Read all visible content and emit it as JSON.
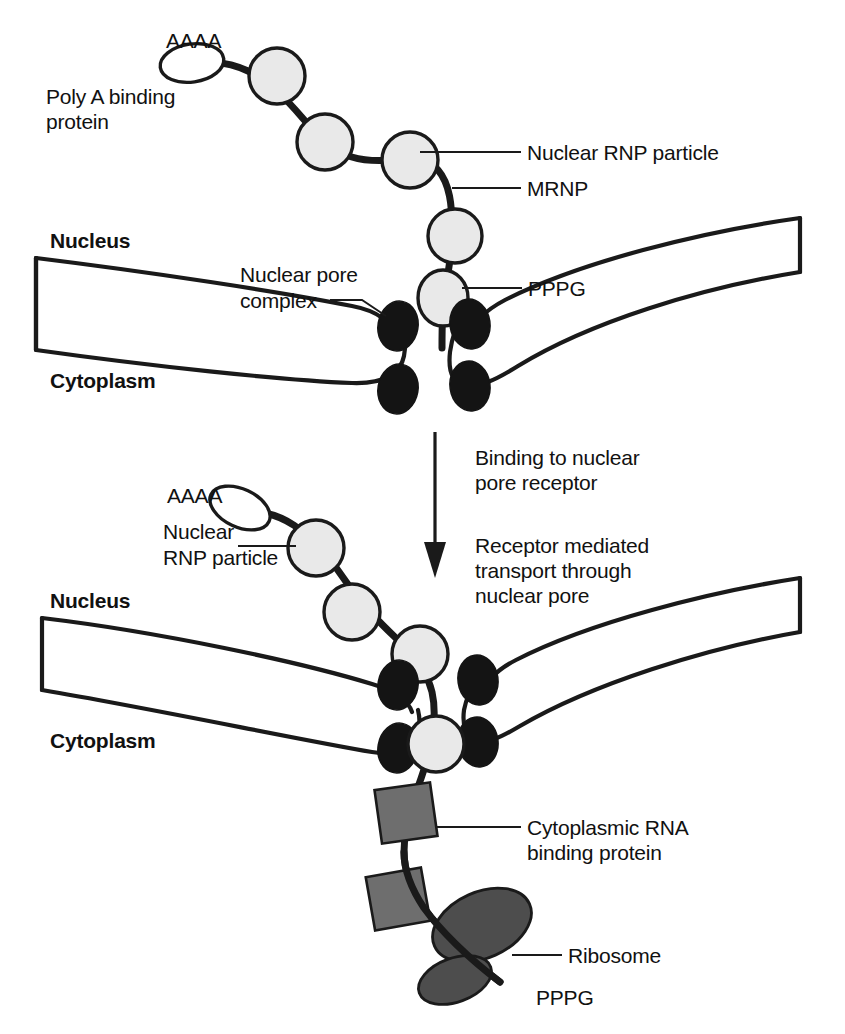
{
  "figure": {
    "background": "#ffffff",
    "ink": "#1a1a1a"
  },
  "colors": {
    "rnp_fill": "#e9e9e9",
    "polya_fill": "#ffffff",
    "pore_fill": "#141414",
    "rbp_fill": "#6e6e6e",
    "ribosome_fill": "#4d4d4d",
    "outline": "#1a1a1a"
  },
  "panel_top": {
    "labels": {
      "poly_a_tail": "AAAA",
      "poly_a_binding_protein_line1": "Poly A binding",
      "poly_a_binding_protein_line2": "protein",
      "nuclear_rnp_particle": "Nuclear RNP particle",
      "mrnp": "MRNP",
      "pppg": "PPPG",
      "nuclear_pore_complex_line1": "Nuclear pore",
      "nuclear_pore_complex_line2": "complex",
      "nucleus": "Nucleus",
      "cytoplasm": "Cytoplasm"
    }
  },
  "transition": {
    "step1_line1": "Binding to nuclear",
    "step1_line2": "pore receptor",
    "step2_line1": "Receptor mediated",
    "step2_line2": "transport through",
    "step2_line3": "nuclear pore"
  },
  "panel_bottom": {
    "labels": {
      "poly_a_tail": "AAAA",
      "nuclear_rnp_particle_line1": "Nuclear",
      "nuclear_rnp_particle_line2": "RNP particle",
      "nucleus": "Nucleus",
      "cytoplasm": "Cytoplasm",
      "cytoplasmic_rna_binding_protein_line1": "Cytoplasmic RNA",
      "cytoplasmic_rna_binding_protein_line2": "binding protein",
      "ribosome": "Ribosome",
      "pppg": "PPPG"
    }
  }
}
